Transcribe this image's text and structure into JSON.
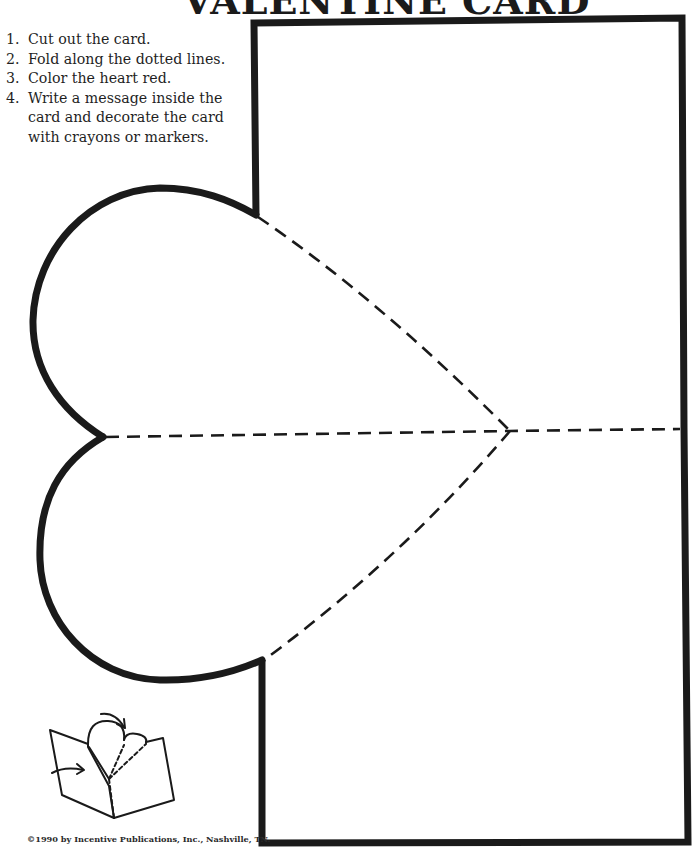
{
  "page": {
    "title": "VALENTINE CARD"
  },
  "instructions": [
    {
      "number": "1.",
      "text": "Cut out the card."
    },
    {
      "number": "2.",
      "text": "Fold along the dotted lines."
    },
    {
      "number": "3.",
      "text": "Color the heart red."
    },
    {
      "number": "4.",
      "text": "Write a message inside the card and decorate the card with crayons or markers."
    }
  ],
  "copyright": "©1990 by Incentive Publications, Inc., Nashville, TN.",
  "colors": {
    "ink": "#1a1a1a",
    "paper": "#ffffff"
  }
}
